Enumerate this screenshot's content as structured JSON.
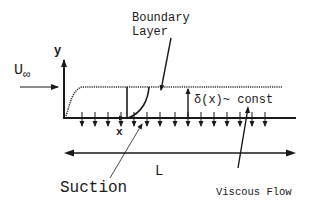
{
  "diagram": {
    "labels": {
      "free_stream": "U",
      "free_stream_sub": "∞",
      "y_axis": "y",
      "x_axis": "x",
      "boundary_layer_line1": "Boundary",
      "boundary_layer_line2": "Layer",
      "thickness": "δ(x)~ const",
      "length": "L",
      "suction": "Suction",
      "viscous_flow": "Viscous Flow"
    },
    "colors": {
      "ink": "#1a1a1a",
      "background": "#ffffff"
    },
    "wall": {
      "y": 118,
      "x_start": 64,
      "x_end": 296
    },
    "boundary_layer_edge": {
      "y": 87,
      "style": "dotted"
    },
    "suction_arrows_x": [
      82,
      95,
      108,
      121,
      134,
      147,
      160,
      175,
      188,
      201,
      214,
      227,
      240,
      252,
      265
    ]
  }
}
